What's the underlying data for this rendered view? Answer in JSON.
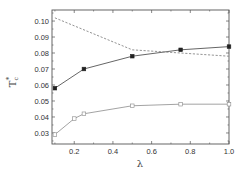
{
  "chart_data": {
    "type": "line",
    "title": "",
    "xlabel": "λ",
    "ylabel": "T_c^*",
    "ylabel_main": "T",
    "ylabel_sub": "c",
    "ylabel_sup": "*",
    "xlim": [
      0.085,
      1.0
    ],
    "ylim": [
      0.0231,
      0.1069
    ],
    "x_ticks": [
      0.2,
      0.4,
      0.6,
      0.8,
      1.0
    ],
    "x_tick_labels": [
      "0.2",
      "0.4",
      "0.6",
      "0.8",
      "1.0"
    ],
    "y_ticks": [
      0.03,
      0.04,
      0.05,
      0.06,
      0.07,
      0.08,
      0.09,
      0.1
    ],
    "y_tick_labels": [
      "0.03",
      "0.04",
      "0.05",
      "0.06",
      "0.07",
      "0.08",
      "0.09",
      "0.10"
    ],
    "grid": false,
    "legend": null,
    "series": [
      {
        "name": "filled-squares",
        "style": "solid",
        "marker": "filled-square",
        "color": "#555555",
        "x": [
          0.1,
          0.25,
          0.5,
          0.75,
          1.0
        ],
        "y": [
          0.058,
          0.07,
          0.078,
          0.082,
          0.084
        ]
      },
      {
        "name": "open-squares",
        "style": "solid",
        "marker": "open-square",
        "color": "#999999",
        "x": [
          0.1,
          0.2,
          0.25,
          0.5,
          0.75,
          1.0
        ],
        "y": [
          0.029,
          0.039,
          0.042,
          0.047,
          0.048,
          0.048
        ]
      },
      {
        "name": "dashed",
        "style": "dashed",
        "marker": "none",
        "color": "#888888",
        "x": [
          0.1,
          0.5,
          1.0
        ],
        "y": [
          0.102,
          0.082,
          0.078
        ]
      }
    ]
  }
}
